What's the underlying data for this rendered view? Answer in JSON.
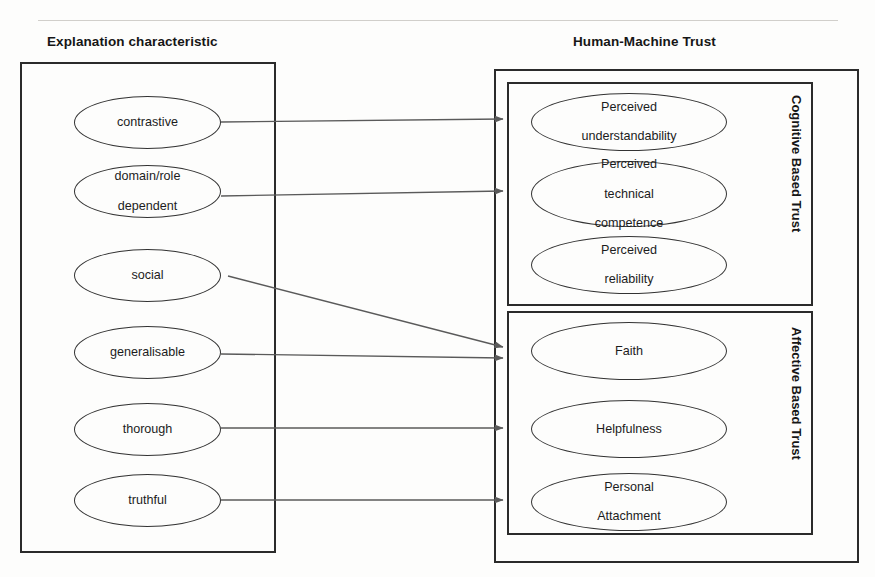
{
  "figure": {
    "headings": {
      "left": "Explanation characteristic",
      "right": "Human-Machine Trust"
    },
    "group_labels": {
      "cognitive": "Cognitive Based Trust",
      "affective": "Affective Based Trust"
    },
    "explanation_characteristics": [
      {
        "id": "contrastive",
        "label": "contrastive"
      },
      {
        "id": "domain-role",
        "label": "domain/role\ndependent",
        "line1": "domain/role",
        "line2": "dependent"
      },
      {
        "id": "social",
        "label": "social"
      },
      {
        "id": "generalisable",
        "label": "generalisable"
      },
      {
        "id": "thorough",
        "label": "thorough"
      },
      {
        "id": "truthful",
        "label": "truthful"
      }
    ],
    "cognitive_based_trust": [
      {
        "id": "perceived-understandability",
        "line1": "Perceived",
        "line2": "understandability",
        "line3": ""
      },
      {
        "id": "perceived-technical-competence",
        "line1": "Perceived",
        "line2": "technical",
        "line3": "competence"
      },
      {
        "id": "perceived-reliability",
        "line1": "Perceived",
        "line2": "reliability",
        "line3": ""
      }
    ],
    "affective_based_trust": [
      {
        "id": "faith",
        "line1": "Faith",
        "line2": "",
        "line3": ""
      },
      {
        "id": "helpfulness",
        "line1": "Helpfulness",
        "line2": "",
        "line3": ""
      },
      {
        "id": "personal-attachment",
        "line1": "Personal",
        "line2": "Attachment",
        "line3": ""
      }
    ],
    "connections": [
      {
        "from": "contrastive",
        "to": "perceived-understandability",
        "style": "horizontal-arrow"
      },
      {
        "from": "domain-role",
        "to": "perceived-technical-competence",
        "style": "horizontal-arrow"
      },
      {
        "from": "social",
        "to": "faith",
        "style": "diagonal-arrow"
      },
      {
        "from": "generalisable",
        "to": "faith",
        "style": "horizontal-arrow"
      },
      {
        "from": "thorough",
        "to": "helpfulness",
        "style": "horizontal-arrow"
      },
      {
        "from": "truthful",
        "to": "personal-attachment",
        "style": "horizontal-arrow"
      }
    ],
    "colors": {
      "background": "#fdfdfc",
      "stroke": "#2b2b2b",
      "node_stroke": "#333333",
      "connector": "#5a5a5a",
      "text": "#1a1a1a"
    }
  }
}
